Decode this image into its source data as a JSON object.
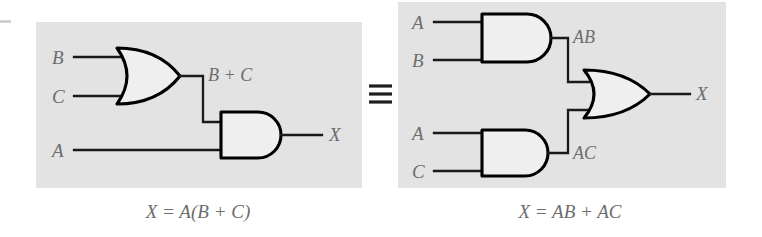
{
  "figure": {
    "equivalence_symbol": "≡",
    "background_color": "#ffffff",
    "panel_color": "#e3e3e3",
    "gate_fill_color": "#efefef",
    "wire_color": "#1a1a1a",
    "label_color": "#6d6d6d"
  },
  "left_circuit": {
    "name": "X = A(B + C) circuit",
    "inputs": [
      {
        "label": "B",
        "x": 58,
        "y": 62
      },
      {
        "label": "C",
        "x": 58,
        "y": 102
      },
      {
        "label": "A",
        "x": 58,
        "y": 155
      }
    ],
    "gates": [
      {
        "type": "OR",
        "name": "or-gate",
        "inputs": [
          "B",
          "C"
        ],
        "output": "B + C"
      },
      {
        "type": "AND",
        "name": "and-gate",
        "inputs": [
          "B + C",
          "A"
        ],
        "output": "X"
      }
    ],
    "intermediate_label": "B + C",
    "output_label": "X",
    "caption": "X = A(B + C)"
  },
  "right_circuit": {
    "name": "X = AB + AC circuit",
    "inputs": [
      {
        "label": "A",
        "x": 418,
        "y": 27
      },
      {
        "label": "B",
        "x": 418,
        "y": 66
      },
      {
        "label": "A",
        "x": 418,
        "y": 138
      },
      {
        "label": "C",
        "x": 418,
        "y": 177
      }
    ],
    "gates": [
      {
        "type": "AND",
        "name": "and-gate-top",
        "inputs": [
          "A",
          "B"
        ],
        "output": "AB"
      },
      {
        "type": "AND",
        "name": "and-gate-bottom",
        "inputs": [
          "A",
          "C"
        ],
        "output": "AC"
      },
      {
        "type": "OR",
        "name": "or-gate",
        "inputs": [
          "AB",
          "AC"
        ],
        "output": "X"
      }
    ],
    "intermediate_labels": [
      "AB",
      "AC"
    ],
    "output_label": "X",
    "caption": "X = AB + AC"
  }
}
